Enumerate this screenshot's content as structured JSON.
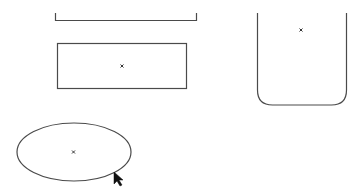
{
  "canvas": {
    "width": 364,
    "height": 195,
    "background": "#ffffff",
    "stroke_color": "#4a4a4a"
  },
  "shapes": [
    {
      "id": "bracket",
      "type": "open-bracket",
      "x1": 55,
      "x2": 197,
      "top": 13,
      "bottom": 20
    },
    {
      "id": "rectangle",
      "type": "rectangle",
      "x": 57.5,
      "y": 43.5,
      "width": 129,
      "height": 45,
      "center_marker": [
        122,
        66
      ]
    },
    {
      "id": "rounded-container",
      "type": "rounded-bottom-rect",
      "left": 257.5,
      "right": 346.5,
      "top": 13,
      "bottom": 105,
      "radius": 15,
      "center_marker": [
        301,
        30
      ]
    },
    {
      "id": "ellipse",
      "type": "ellipse",
      "cx": 74,
      "cy": 152,
      "rx": 57,
      "ry": 29,
      "center_marker": [
        73,
        152
      ]
    }
  ],
  "cursor": {
    "type": "arrow-cursor",
    "x": 114,
    "y": 172
  },
  "marker_glyph": "×"
}
